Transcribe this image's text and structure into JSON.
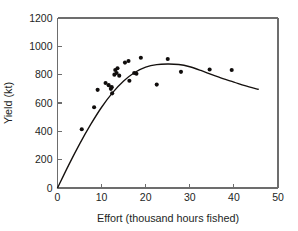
{
  "chart_data": {
    "type": "scatter",
    "title": "",
    "xlabel": "Effort (thousand hours fished)",
    "ylabel": "Yield (kt)",
    "xlim": [
      0,
      50
    ],
    "ylim": [
      0,
      1200
    ],
    "xticks": [
      0,
      10,
      20,
      30,
      40,
      50
    ],
    "yticks": [
      0,
      200,
      400,
      600,
      800,
      1000,
      1200
    ],
    "xtick_labels": [
      "0",
      "10",
      "20",
      "30",
      "40",
      "50"
    ],
    "ytick_labels": [
      "0",
      "200",
      "400",
      "600",
      "800",
      "1000",
      "1200"
    ],
    "grid": false,
    "legend": null,
    "frame": "box",
    "tick_direction": "in",
    "point_color": "#100d0c",
    "curve_color": "#15110f",
    "axis_color": "#6d6d6d",
    "points": [
      {
        "x": 5.5,
        "y": 415
      },
      {
        "x": 8.3,
        "y": 570
      },
      {
        "x": 9.1,
        "y": 693
      },
      {
        "x": 10.9,
        "y": 741
      },
      {
        "x": 11.6,
        "y": 726
      },
      {
        "x": 12.1,
        "y": 700
      },
      {
        "x": 12.3,
        "y": 712
      },
      {
        "x": 12.4,
        "y": 668
      },
      {
        "x": 12.9,
        "y": 800
      },
      {
        "x": 13.1,
        "y": 833
      },
      {
        "x": 13.4,
        "y": 812
      },
      {
        "x": 13.6,
        "y": 845
      },
      {
        "x": 14.0,
        "y": 793
      },
      {
        "x": 15.3,
        "y": 885
      },
      {
        "x": 16.1,
        "y": 896
      },
      {
        "x": 16.3,
        "y": 757
      },
      {
        "x": 17.4,
        "y": 812
      },
      {
        "x": 17.9,
        "y": 806
      },
      {
        "x": 18.9,
        "y": 919
      },
      {
        "x": 22.5,
        "y": 730
      },
      {
        "x": 25.0,
        "y": 911
      },
      {
        "x": 28.0,
        "y": 820
      },
      {
        "x": 34.5,
        "y": 836
      },
      {
        "x": 39.5,
        "y": 833
      }
    ],
    "curve": {
      "name": "fitted-yield-effort-curve",
      "form": "quadratic-through-origin",
      "peak_x": 26,
      "peak_y": 875,
      "x_range": [
        0,
        45.5
      ],
      "samples": [
        {
          "x": 0,
          "y": 0
        },
        {
          "x": 2.5,
          "y": 160
        },
        {
          "x": 5,
          "y": 310
        },
        {
          "x": 7.5,
          "y": 447
        },
        {
          "x": 10,
          "y": 570
        },
        {
          "x": 12.5,
          "y": 673
        },
        {
          "x": 15,
          "y": 755
        },
        {
          "x": 17.5,
          "y": 815
        },
        {
          "x": 20,
          "y": 853
        },
        {
          "x": 22.5,
          "y": 871
        },
        {
          "x": 25,
          "y": 875
        },
        {
          "x": 27.5,
          "y": 872
        },
        {
          "x": 30,
          "y": 856
        },
        {
          "x": 32.5,
          "y": 830
        },
        {
          "x": 35,
          "y": 800
        },
        {
          "x": 37.5,
          "y": 772
        },
        {
          "x": 40,
          "y": 748
        },
        {
          "x": 42.5,
          "y": 722
        },
        {
          "x": 45.5,
          "y": 697
        }
      ]
    }
  }
}
